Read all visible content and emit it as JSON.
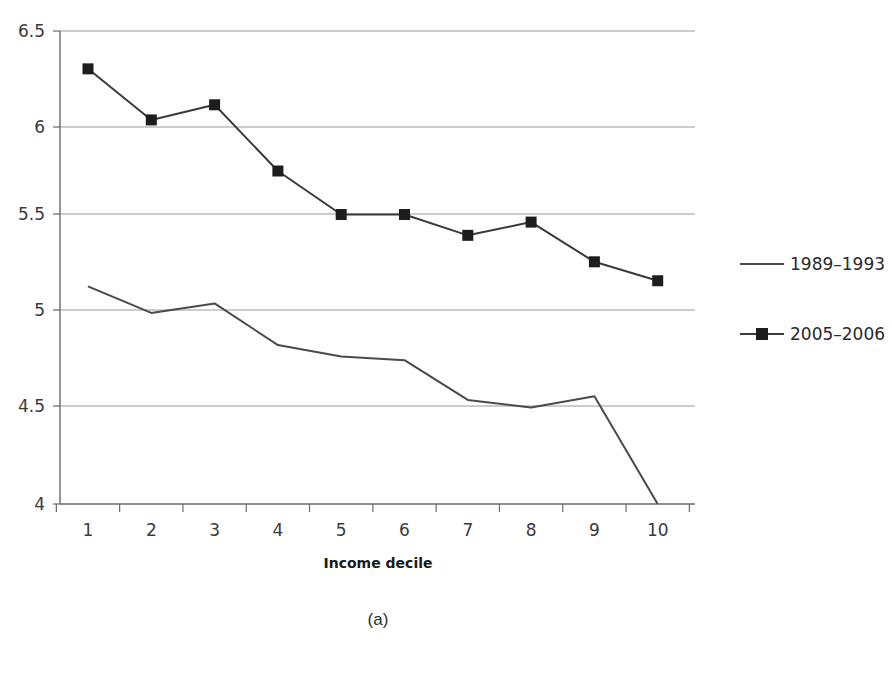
{
  "chart_data": {
    "type": "line",
    "title": "",
    "subtitle": "",
    "xlabel": "Income decile",
    "ylabel": "",
    "categories": [
      "1",
      "2",
      "3",
      "4",
      "5",
      "6",
      "7",
      "8",
      "9",
      "10"
    ],
    "x": [
      1,
      2,
      3,
      4,
      5,
      6,
      7,
      8,
      9,
      10
    ],
    "series": [
      {
        "name": "1989–1993",
        "marker": "none",
        "color": "#4a4a4a",
        "values": [
          5.15,
          5.01,
          5.06,
          4.84,
          4.78,
          4.76,
          4.55,
          4.51,
          4.57,
          4.0
        ]
      },
      {
        "name": "2005–2006",
        "marker": "square",
        "color": "#3a3a3a",
        "values": [
          6.3,
          6.03,
          6.11,
          5.76,
          5.53,
          5.53,
          5.42,
          5.49,
          5.28,
          5.18
        ]
      }
    ],
    "ylim": [
      4,
      6.5
    ],
    "yticks": [
      4,
      4.5,
      5,
      5.5,
      6,
      6.5
    ],
    "ytick_labels": [
      "4",
      "4.5",
      "5",
      "5.5",
      "6",
      "6.5"
    ],
    "grid": true,
    "grid_axis": "y",
    "legend_position": "right",
    "legend_entries": [
      "1989–1993",
      "2005–2006"
    ]
  },
  "caption": {
    "label": "(a)"
  },
  "colors": {
    "line_1989": "#4a4a4a",
    "line_2005": "#3a3a3a",
    "grid": "#9a9a9a",
    "axis": "#6a6a6a",
    "text": "#2b2b2b",
    "background": "#ffffff"
  }
}
